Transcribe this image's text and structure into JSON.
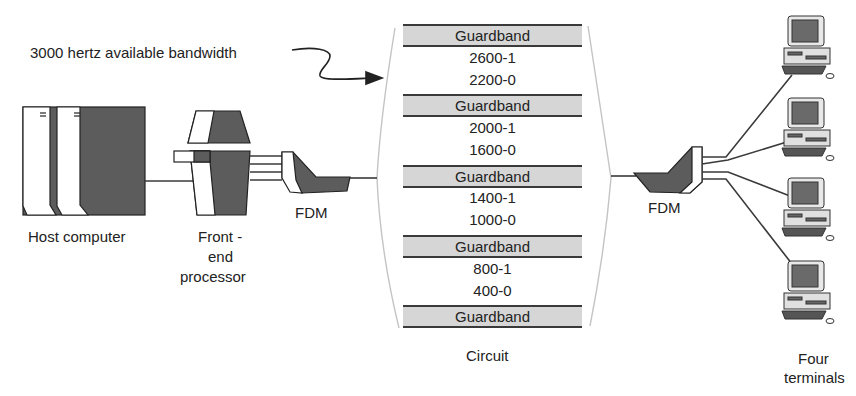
{
  "annotation": {
    "text": "3000 hertz available bandwidth"
  },
  "circuit": {
    "label": "Circuit",
    "bands": [
      {
        "type": "guardband",
        "label": "Guardband"
      },
      {
        "type": "frequency",
        "label": "2600-1"
      },
      {
        "type": "frequency",
        "label": "2200-0"
      },
      {
        "type": "guardband",
        "label": "Guardband"
      },
      {
        "type": "frequency",
        "label": "2000-1"
      },
      {
        "type": "frequency",
        "label": "1600-0"
      },
      {
        "type": "guardband",
        "label": "Guardband"
      },
      {
        "type": "frequency",
        "label": "1400-1"
      },
      {
        "type": "frequency",
        "label": "1000-0"
      },
      {
        "type": "guardband",
        "label": "Guardband"
      },
      {
        "type": "frequency",
        "label": "800-1"
      },
      {
        "type": "frequency",
        "label": "400-0"
      },
      {
        "type": "guardband",
        "label": "Guardband"
      }
    ]
  },
  "nodes": {
    "host": {
      "label": "Host computer"
    },
    "fep": {
      "line1": "Front -",
      "line2": "end",
      "line3": "processor"
    },
    "fdm_left": {
      "label": "FDM"
    },
    "fdm_right": {
      "label": "FDM"
    },
    "terminals": {
      "line1": "Four",
      "line2": "terminals",
      "count": 4
    }
  },
  "colors": {
    "dark_fill": "#5a5a5a",
    "guardband_fill": "#d6d6d6",
    "line": "#3a3a3a",
    "circuit_edge": "#bdbdbd"
  }
}
